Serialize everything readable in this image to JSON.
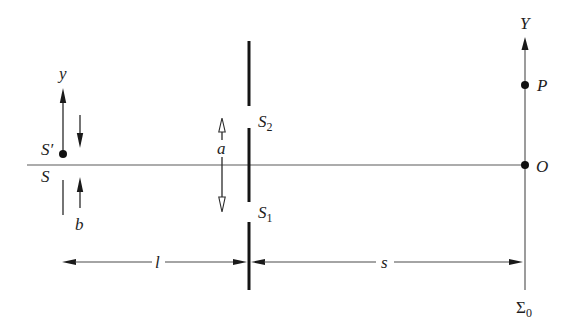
{
  "figure": {
    "type": "double-slit interference geometry",
    "labels": {
      "source_image": "S′",
      "source": "S",
      "source_axis": "y",
      "source_width": "b",
      "slit_separation": "a",
      "slit2": {
        "main": "S",
        "sub": "2"
      },
      "slit1": {
        "main": "S",
        "sub": "1"
      },
      "source_to_slits": "l",
      "slits_to_screen": "s",
      "screen_axis": "Y",
      "point": "P",
      "origin": "O",
      "screen": {
        "main": "Σ",
        "sub": "0"
      }
    }
  }
}
